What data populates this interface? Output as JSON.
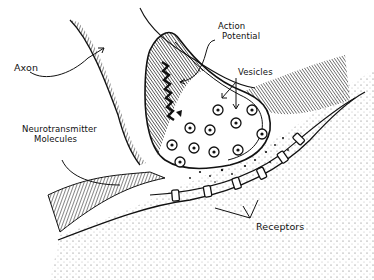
{
  "diagram": {
    "type": "illustration",
    "style": "pen-and-ink line drawing",
    "colors": {
      "ink": "#111111",
      "background": "#ffffff"
    },
    "labels": {
      "axon": "Axon",
      "action_potential_line1": "Action",
      "action_potential_line2": "Potential",
      "vesicles": "Vesicles",
      "neurotransmitter_line1": "Neurotransmitter",
      "neurotransmitter_line2": "Molecules",
      "receptors": "Receptors"
    }
  }
}
